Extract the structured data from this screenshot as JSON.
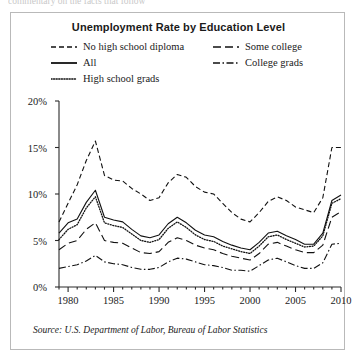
{
  "top_fragment": "commentary on the facts that follow",
  "figure": {
    "title": "Unemployment Rate by Education Level",
    "source_note": "Source: U.S. Department of Labor, Bureau of Labor Statistics"
  },
  "legend": {
    "items": [
      {
        "label": "No high school diploma",
        "style": "dashed",
        "column": 1,
        "row": 1
      },
      {
        "label": "All",
        "style": "solid",
        "column": 1,
        "row": 2
      },
      {
        "label": "High school grads",
        "style": "dotted",
        "column": 1,
        "row": 3
      },
      {
        "label": "Some college",
        "style": "longdash",
        "column": 2,
        "row": 1
      },
      {
        "label": "College grads",
        "style": "dashdot",
        "column": 2,
        "row": 2
      }
    ]
  },
  "chart_data": {
    "type": "line",
    "title": "Unemployment Rate by Education Level",
    "xlabel": "",
    "ylabel": "",
    "xlim": [
      1979,
      2010
    ],
    "ylim": [
      0,
      20
    ],
    "y_tick_labels": [
      "0%",
      "5%",
      "10%",
      "15%",
      "20%"
    ],
    "y_ticks": [
      0,
      5,
      10,
      15,
      20
    ],
    "x_tick_labels": [
      "1980",
      "1985",
      "1990",
      "1995",
      "2000",
      "2005",
      "2010"
    ],
    "x_ticks": [
      1980,
      1985,
      1990,
      1995,
      2000,
      2005,
      2010
    ],
    "x_minor_tick_interval": 1,
    "grid": false,
    "legend_position": "top",
    "x": [
      1979,
      1980,
      1981,
      1982,
      1983,
      1984,
      1985,
      1986,
      1987,
      1988,
      1989,
      1990,
      1991,
      1992,
      1993,
      1994,
      1995,
      1996,
      1997,
      1998,
      1999,
      2000,
      2001,
      2002,
      2003,
      2004,
      2005,
      2006,
      2007,
      2008,
      2009,
      2010
    ],
    "series": [
      {
        "name": "No high school diploma",
        "style": "dashed",
        "values": [
          7.0,
          9.0,
          11.0,
          13.6,
          15.7,
          12.0,
          11.5,
          11.4,
          10.6,
          10.0,
          9.3,
          9.6,
          11.2,
          12.1,
          11.8,
          10.8,
          10.2,
          10.0,
          9.0,
          8.0,
          7.3,
          7.0,
          8.0,
          9.2,
          9.7,
          9.3,
          8.6,
          8.3,
          8.0,
          9.6,
          15.0,
          15.0
        ]
      },
      {
        "name": "All",
        "style": "solid",
        "values": [
          5.8,
          6.9,
          7.3,
          9.1,
          10.4,
          7.5,
          7.2,
          7.0,
          6.2,
          5.5,
          5.3,
          5.6,
          6.8,
          7.5,
          6.9,
          6.1,
          5.6,
          5.4,
          4.9,
          4.5,
          4.2,
          4.0,
          4.8,
          5.8,
          6.0,
          5.5,
          5.1,
          4.6,
          4.6,
          5.8,
          9.3,
          9.9
        ]
      },
      {
        "name": "High school grads",
        "style": "dotted",
        "values": [
          5.1,
          6.2,
          6.7,
          8.5,
          9.7,
          6.9,
          6.6,
          6.4,
          5.7,
          5.0,
          4.8,
          5.1,
          6.3,
          7.0,
          6.4,
          5.6,
          5.1,
          4.9,
          4.4,
          4.1,
          3.8,
          3.6,
          4.4,
          5.4,
          5.6,
          5.1,
          4.7,
          4.3,
          4.4,
          5.5,
          9.0,
          9.5
        ]
      },
      {
        "name": "Some college",
        "style": "longdash",
        "values": [
          4.0,
          4.7,
          5.0,
          6.2,
          6.9,
          5.0,
          4.8,
          4.7,
          4.2,
          3.7,
          3.6,
          3.8,
          4.8,
          5.3,
          5.0,
          4.5,
          4.2,
          4.0,
          3.6,
          3.3,
          3.1,
          2.9,
          3.6,
          4.6,
          4.8,
          4.4,
          4.0,
          3.7,
          3.7,
          4.5,
          7.5,
          8.1
        ]
      },
      {
        "name": "College grads",
        "style": "dashdot",
        "values": [
          2.0,
          2.2,
          2.4,
          2.8,
          3.4,
          2.7,
          2.5,
          2.4,
          2.1,
          1.9,
          1.9,
          2.1,
          2.7,
          3.1,
          3.0,
          2.7,
          2.4,
          2.3,
          2.1,
          1.8,
          1.8,
          1.7,
          2.3,
          2.9,
          3.1,
          2.7,
          2.3,
          2.0,
          2.0,
          2.6,
          4.6,
          4.7
        ]
      }
    ]
  }
}
